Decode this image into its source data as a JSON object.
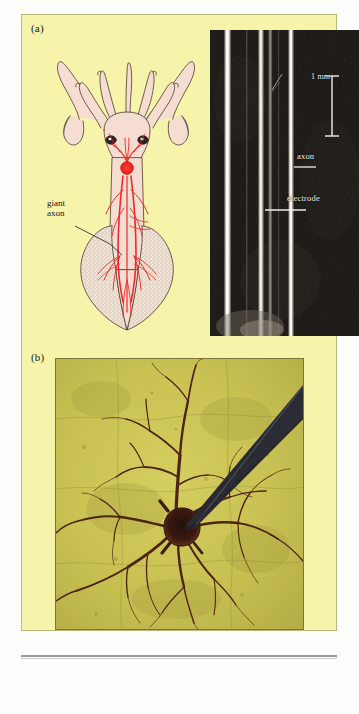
{
  "figure": {
    "panels": [
      {
        "letter": "(a)",
        "drawing": {
          "name": "squid-anatomy-drawing",
          "label": "giant\naxon",
          "label_line1": "giant",
          "label_line2": "axon",
          "body_color": "#f6ddd2",
          "nerve_color": "#ee2b24",
          "outline_color": "#4a3a2e"
        },
        "micrograph": {
          "name": "axon-electrode-micrograph",
          "background_color": "#0d0b09",
          "scalebar_label": "1 mm",
          "labels": [
            "axon",
            "electrode"
          ],
          "axon_label": "axon",
          "electrode_label": "electrode"
        }
      },
      {
        "letter": "(b)",
        "micrograph": {
          "name": "stained-neuron-micrograph",
          "background_color": "#c9c24e",
          "neuron_color": "#4a1d0c",
          "electrode_color": "#2b2b33"
        }
      }
    ]
  }
}
